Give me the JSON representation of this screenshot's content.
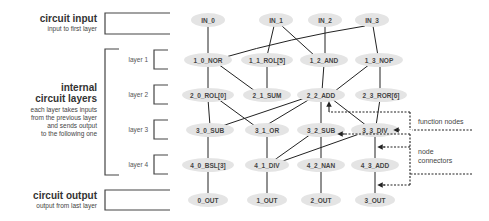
{
  "left_panel": {
    "input": {
      "title": "circuit input",
      "subtitle": "input to first layer"
    },
    "internal": {
      "title_lines": [
        "internal",
        "circuit layers"
      ],
      "subtitle_lines": [
        "each layer takes inputs",
        "from the previous layer",
        "and sends output",
        "to the following one"
      ]
    },
    "output": {
      "title": "circuit output",
      "subtitle": "output from last layer"
    },
    "layers": [
      "layer 1",
      "layer 2",
      "layer 3",
      "layer 4"
    ]
  },
  "nodes": {
    "inputs": [
      "IN_0",
      "IN_1",
      "IN_2",
      "IN_3"
    ],
    "layer1": [
      "1_0_NOR",
      "1_1_ROL[5]",
      "1_2_AND",
      "1_3_NOP"
    ],
    "layer2": [
      "2_0_ROL[0]",
      "2_1_SUM",
      "2_2_ADD",
      "2_3_ROR[6]"
    ],
    "layer3": [
      "3_0_SUB",
      "3_1_OR",
      "3_2_SUB",
      "3_3_DIV"
    ],
    "layer4": [
      "4_0_BSL[3]",
      "4_1_DIV",
      "4_2_NAN",
      "4_3_ADD"
    ],
    "outputs": [
      "0_OUT",
      "1_OUT",
      "2_OUT",
      "3_OUT"
    ]
  },
  "connections": [
    [
      "IN_0",
      "1_0_NOR"
    ],
    [
      "IN_3",
      "1_0_NOR"
    ],
    [
      "IN_1",
      "1_1_ROL[5]"
    ],
    [
      "IN_1",
      "1_2_AND"
    ],
    [
      "IN_2",
      "1_2_AND"
    ],
    [
      "IN_3",
      "1_3_NOP"
    ],
    [
      "1_0_NOR",
      "2_0_ROL[0]"
    ],
    [
      "1_0_NOR",
      "2_1_SUM"
    ],
    [
      "1_1_ROL[5]",
      "2_1_SUM"
    ],
    [
      "1_2_AND",
      "2_2_ADD"
    ],
    [
      "1_3_NOP",
      "2_2_ADD"
    ],
    [
      "1_3_NOP",
      "2_3_ROR[6]"
    ],
    [
      "2_0_ROL[0]",
      "3_0_SUB"
    ],
    [
      "2_0_ROL[0]",
      "3_1_OR"
    ],
    [
      "2_2_ADD",
      "3_0_SUB"
    ],
    [
      "2_2_ADD",
      "3_1_OR"
    ],
    [
      "2_2_ADD",
      "3_2_SUB"
    ],
    [
      "2_2_ADD",
      "3_3_DIV"
    ],
    [
      "2_3_ROR[6]",
      "3_3_DIV"
    ],
    [
      "3_0_SUB",
      "4_0_BSL[3]"
    ],
    [
      "3_1_OR",
      "4_1_DIV"
    ],
    [
      "3_2_SUB",
      "4_1_DIV"
    ],
    [
      "3_3_DIV",
      "4_1_DIV"
    ],
    [
      "3_2_SUB",
      "4_2_NAN"
    ],
    [
      "3_3_DIV",
      "4_3_ADD"
    ],
    [
      "4_0_BSL[3]",
      "0_OUT"
    ],
    [
      "4_1_DIV",
      "1_OUT"
    ],
    [
      "4_2_NAN",
      "2_OUT"
    ],
    [
      "4_3_ADD",
      "3_OUT"
    ]
  ],
  "annotations": {
    "function_nodes": "function nodes",
    "node_connectors_lines": [
      "node",
      "connectors"
    ]
  },
  "colors": {
    "node_fill": "#e4e4e4",
    "line": "#222222",
    "bracket": "#444444"
  }
}
